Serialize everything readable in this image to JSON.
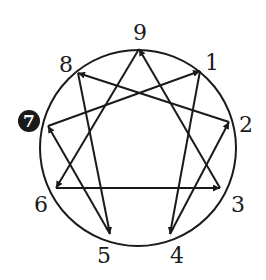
{
  "diagram": {
    "colors": {
      "line": "#1a1a1a",
      "background": "#ffffff",
      "highlight_fill": "#1a1a1a",
      "highlight_text": "#ffffff"
    },
    "circle": {
      "cx": 138,
      "cy": 148,
      "r": 98
    },
    "highlighted_point": "7",
    "points": [
      {
        "id": "9",
        "label": "9",
        "x": 139,
        "y": 49,
        "lx": 140,
        "ly": 34
      },
      {
        "id": "1",
        "label": "1",
        "x": 200,
        "y": 71,
        "lx": 212,
        "ly": 64
      },
      {
        "id": "2",
        "label": "2",
        "x": 229,
        "y": 122,
        "lx": 246,
        "ly": 126
      },
      {
        "id": "3",
        "label": "3",
        "x": 220,
        "y": 188,
        "lx": 238,
        "ly": 206
      },
      {
        "id": "4",
        "label": "4",
        "x": 170,
        "y": 234,
        "lx": 177,
        "ly": 257
      },
      {
        "id": "5",
        "label": "5",
        "x": 110,
        "y": 234,
        "lx": 104,
        "ly": 257
      },
      {
        "id": "6",
        "label": "6",
        "x": 56,
        "y": 188,
        "lx": 41,
        "ly": 206
      },
      {
        "id": "7",
        "label": "7",
        "x": 48,
        "y": 126,
        "lx": 29,
        "ly": 128
      },
      {
        "id": "8",
        "label": "8",
        "x": 78,
        "y": 73,
        "lx": 66,
        "ly": 66
      }
    ],
    "arrows": [
      {
        "from": "2",
        "to": "8"
      },
      {
        "from": "7",
        "to": "1"
      },
      {
        "from": "3",
        "to": "9"
      },
      {
        "from": "1",
        "to": "4"
      },
      {
        "from": "9",
        "to": "6"
      },
      {
        "from": "8",
        "to": "5"
      },
      {
        "from": "6",
        "to": "3"
      },
      {
        "from": "4",
        "to": "2"
      },
      {
        "from": "5",
        "to": "7"
      }
    ]
  }
}
